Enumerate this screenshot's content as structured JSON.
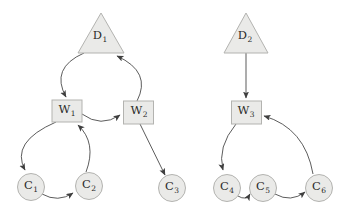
{
  "diagram": {
    "type": "directed-graph",
    "background_color": "#ffffff",
    "node_fill_color": "#eaeae8",
    "node_border_color": "#b3b3b0",
    "edge_color": "#3f3f3f",
    "label_color": "#2a2a2a",
    "nodes": {
      "D1": {
        "base": "D",
        "sub": "1",
        "shape": "triangle",
        "group": "left"
      },
      "W1": {
        "base": "W",
        "sub": "1",
        "shape": "rectangle",
        "group": "left"
      },
      "W2": {
        "base": "W",
        "sub": "2",
        "shape": "rectangle",
        "group": "left"
      },
      "C1": {
        "base": "C",
        "sub": "1",
        "shape": "circle",
        "group": "left"
      },
      "C2": {
        "base": "C",
        "sub": "2",
        "shape": "circle",
        "group": "left"
      },
      "C3": {
        "base": "C",
        "sub": "3",
        "shape": "circle",
        "group": "left"
      },
      "D2": {
        "base": "D",
        "sub": "2",
        "shape": "triangle",
        "group": "right"
      },
      "W3": {
        "base": "W",
        "sub": "3",
        "shape": "rectangle",
        "group": "right"
      },
      "C4": {
        "base": "C",
        "sub": "4",
        "shape": "circle",
        "group": "right"
      },
      "C5": {
        "base": "C",
        "sub": "5",
        "shape": "circle",
        "group": "right"
      },
      "C6": {
        "base": "C",
        "sub": "6",
        "shape": "circle",
        "group": "right"
      }
    },
    "edges": [
      {
        "from": "D1",
        "to": "W1",
        "style": "curved"
      },
      {
        "from": "W2",
        "to": "D1",
        "style": "curved"
      },
      {
        "from": "W1",
        "to": "W2",
        "style": "curved"
      },
      {
        "from": "W1",
        "to": "C1",
        "style": "curved"
      },
      {
        "from": "C2",
        "to": "W1",
        "style": "curved"
      },
      {
        "from": "C1",
        "to": "C2",
        "style": "curved"
      },
      {
        "from": "W2",
        "to": "C3",
        "style": "straight"
      },
      {
        "from": "D2",
        "to": "W3",
        "style": "straight"
      },
      {
        "from": "W3",
        "to": "C4",
        "style": "curved"
      },
      {
        "from": "C4",
        "to": "C5",
        "style": "curved"
      },
      {
        "from": "C5",
        "to": "C6",
        "style": "curved"
      },
      {
        "from": "C6",
        "to": "W3",
        "style": "curved"
      }
    ]
  }
}
